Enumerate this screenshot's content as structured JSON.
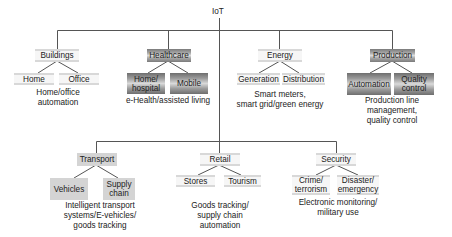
{
  "root": {
    "label": "IoT"
  },
  "top_row": [
    {
      "label": "Buildings",
      "style": "light",
      "children": [
        "Home",
        "Office"
      ],
      "description": [
        "Home/office",
        "automation"
      ]
    },
    {
      "label": "Healthcare",
      "style": "dark",
      "children": [
        "Home/\nhospital",
        "Mobile"
      ],
      "children_lines": [
        [
          "Home/",
          "hospital"
        ],
        [
          "Mobile"
        ]
      ],
      "description": [
        "e-Health/assisted living"
      ]
    },
    {
      "label": "Energy",
      "style": "light",
      "children": [
        "Generation",
        "Distribution"
      ],
      "description": [
        "Smart meters,",
        "smart grid/green energy"
      ]
    },
    {
      "label": "Production",
      "style": "dark",
      "children": [
        "Automation",
        "Quality control"
      ],
      "children_lines": [
        [
          "Automation"
        ],
        [
          "Quality",
          "control"
        ]
      ],
      "description": [
        "Production line",
        "management,",
        "quality control"
      ]
    }
  ],
  "bottom_row": [
    {
      "label": "Transport",
      "style": "solid",
      "children": [
        "Vehicles",
        "Supply chain"
      ],
      "children_lines": [
        [
          "Vehicles"
        ],
        [
          "Supply",
          "chain"
        ]
      ],
      "description": [
        "Intelligent transport",
        "systems/E-vehicles/",
        "goods tracking"
      ]
    },
    {
      "label": "Retail",
      "style": "light",
      "children": [
        "Stores",
        "Tourism"
      ],
      "description": [
        "Goods tracking/",
        "supply chain",
        "automation"
      ]
    },
    {
      "label": "Security",
      "style": "light",
      "children": [
        "Crime/terrorism",
        "Disaster/emergency"
      ],
      "children_lines": [
        [
          "Crime/",
          "terrorism"
        ],
        [
          "Disaster/",
          "emergency"
        ]
      ],
      "description": [
        "Electronic monitoring/",
        "military use"
      ]
    }
  ],
  "colors": {
    "line": "#555555",
    "dark_box": "#7a7a7a",
    "solid_box": "#d4d4d4",
    "light_stripe": "#d0d0d0"
  }
}
